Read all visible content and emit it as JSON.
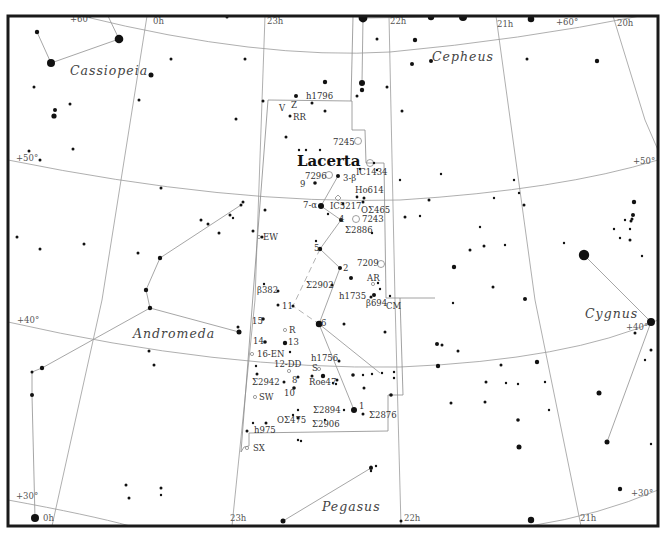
{
  "chart": {
    "title": "Lacerta",
    "frame": {
      "x": 8,
      "y": 16,
      "width": 650,
      "height": 510
    },
    "colors": {
      "background": "#ffffff",
      "stars": "#111111",
      "grid": "#9a9a9a",
      "boundary": "#8a8a8a",
      "figure": "#9c9c9c",
      "frame": "#1a1a1a"
    }
  },
  "ra_labels": [
    {
      "text": "0h",
      "x": 153,
      "y": 24
    },
    {
      "text": "23h",
      "x": 267,
      "y": 24
    },
    {
      "text": "22h",
      "x": 390,
      "y": 24
    },
    {
      "text": "21h",
      "x": 497,
      "y": 27
    },
    {
      "text": "20h",
      "x": 617,
      "y": 26
    },
    {
      "text": "0h",
      "x": 43,
      "y": 521
    },
    {
      "text": "23h",
      "x": 230,
      "y": 521
    },
    {
      "text": "22h",
      "x": 404,
      "y": 521
    },
    {
      "text": "21h",
      "x": 580,
      "y": 521
    }
  ],
  "dec_labels": [
    {
      "text": "+60°",
      "x": 70,
      "y": 22
    },
    {
      "text": "+60°",
      "x": 556,
      "y": 25
    },
    {
      "text": "+50°",
      "x": 16,
      "y": 161
    },
    {
      "text": "+50°",
      "x": 633,
      "y": 164
    },
    {
      "text": "+40°",
      "x": 17,
      "y": 323
    },
    {
      "text": "+40°",
      "x": 626,
      "y": 330
    },
    {
      "text": "+30°",
      "x": 16,
      "y": 499
    },
    {
      "text": "+30°",
      "x": 631,
      "y": 496
    }
  ],
  "constellations": [
    {
      "name": "Lacerta",
      "x": 297,
      "y": 166,
      "main": true
    },
    {
      "name": "Cassiopeia",
      "x": 70,
      "y": 75
    },
    {
      "name": "Cepheus",
      "x": 432,
      "y": 61
    },
    {
      "name": "Andromeda",
      "x": 133,
      "y": 338
    },
    {
      "name": "Cygnus",
      "x": 585,
      "y": 318
    },
    {
      "name": "Pegasus",
      "x": 322,
      "y": 511
    }
  ],
  "object_labels": [
    {
      "text": "h1796",
      "x": 306,
      "y": 99
    },
    {
      "text": "V",
      "x": 279,
      "y": 111
    },
    {
      "text": "Z",
      "x": 291,
      "y": 108
    },
    {
      "text": "RR",
      "x": 293,
      "y": 120
    },
    {
      "text": "7245",
      "x": 333,
      "y": 145
    },
    {
      "text": "IC1434",
      "x": 356,
      "y": 175
    },
    {
      "text": "7296",
      "x": 305,
      "y": 179
    },
    {
      "text": "3-β",
      "x": 343,
      "y": 181
    },
    {
      "text": "9",
      "x": 300,
      "y": 187
    },
    {
      "text": "Ho614",
      "x": 355,
      "y": 193
    },
    {
      "text": "7-α",
      "x": 303,
      "y": 208
    },
    {
      "text": "IC5217",
      "x": 330,
      "y": 209
    },
    {
      "text": "OΣ465",
      "x": 361,
      "y": 213
    },
    {
      "text": "4",
      "x": 339,
      "y": 222
    },
    {
      "text": "7243",
      "x": 362,
      "y": 222
    },
    {
      "text": "Σ2886",
      "x": 345,
      "y": 233
    },
    {
      "text": "EW",
      "x": 263,
      "y": 240
    },
    {
      "text": "5",
      "x": 314,
      "y": 251
    },
    {
      "text": "7209",
      "x": 357,
      "y": 266
    },
    {
      "text": "2",
      "x": 343,
      "y": 271
    },
    {
      "text": "AR",
      "x": 367,
      "y": 281
    },
    {
      "text": "Σ2902",
      "x": 306,
      "y": 288
    },
    {
      "text": "h1735",
      "x": 339,
      "y": 299
    },
    {
      "text": "β382",
      "x": 257,
      "y": 293
    },
    {
      "text": "β694",
      "x": 366,
      "y": 306
    },
    {
      "text": "CM",
      "x": 386,
      "y": 309
    },
    {
      "text": "11",
      "x": 282,
      "y": 309
    },
    {
      "text": "15",
      "x": 252,
      "y": 324
    },
    {
      "text": "6",
      "x": 321,
      "y": 326
    },
    {
      "text": "R",
      "x": 289,
      "y": 333
    },
    {
      "text": "14",
      "x": 253,
      "y": 344
    },
    {
      "text": "13",
      "x": 288,
      "y": 345
    },
    {
      "text": "16-EN",
      "x": 257,
      "y": 357
    },
    {
      "text": "h1756",
      "x": 311,
      "y": 361
    },
    {
      "text": "12-DD",
      "x": 274,
      "y": 367
    },
    {
      "text": "S",
      "x": 312,
      "y": 371
    },
    {
      "text": "Σ2942",
      "x": 252,
      "y": 385
    },
    {
      "text": "8",
      "x": 292,
      "y": 383
    },
    {
      "text": "Roe47",
      "x": 309,
      "y": 385
    },
    {
      "text": "10",
      "x": 284,
      "y": 396
    },
    {
      "text": "SW",
      "x": 259,
      "y": 400
    },
    {
      "text": "Σ2894",
      "x": 313,
      "y": 413
    },
    {
      "text": "1",
      "x": 359,
      "y": 409
    },
    {
      "text": "Σ2876",
      "x": 369,
      "y": 418
    },
    {
      "text": "OΣ475",
      "x": 277,
      "y": 423
    },
    {
      "text": "Σ2906",
      "x": 312,
      "y": 427
    },
    {
      "text": "h975",
      "x": 254,
      "y": 433
    },
    {
      "text": "SX",
      "x": 253,
      "y": 451
    }
  ],
  "dso_markers": [
    {
      "type": "circle",
      "x": 358,
      "y": 141,
      "r": 3.5,
      "label": "7245"
    },
    {
      "type": "circle",
      "x": 370,
      "y": 163,
      "r": 3.5,
      "label": "IC1434"
    },
    {
      "type": "circle",
      "x": 329,
      "y": 175,
      "r": 3.5,
      "label": "7296"
    },
    {
      "type": "diamond",
      "x": 338,
      "y": 198,
      "r": 3,
      "label": "IC5217"
    },
    {
      "type": "circle",
      "x": 356,
      "y": 219,
      "r": 3.5,
      "label": "7243"
    },
    {
      "type": "circle",
      "x": 381,
      "y": 264,
      "r": 3.5,
      "label": "7209"
    },
    {
      "type": "small",
      "x": 373,
      "y": 284,
      "r": 1.6,
      "label": "AR"
    },
    {
      "type": "small",
      "x": 259,
      "y": 237,
      "r": 1.6,
      "label": "EW"
    },
    {
      "type": "small",
      "x": 285,
      "y": 330,
      "r": 1.6,
      "label": "R"
    },
    {
      "type": "small",
      "x": 252,
      "y": 354,
      "r": 1.6,
      "label": "16-EN"
    },
    {
      "type": "small",
      "x": 289,
      "y": 371,
      "r": 1.6,
      "label": "12-DD"
    },
    {
      "type": "small",
      "x": 319,
      "y": 369,
      "r": 1.6,
      "label": "S"
    },
    {
      "type": "small",
      "x": 255,
      "y": 397,
      "r": 1.6,
      "label": "SW"
    },
    {
      "type": "small",
      "x": 247,
      "y": 448,
      "r": 1.6,
      "label": "SX"
    }
  ],
  "stars": [
    [
      37,
      32,
      2.2
    ],
    [
      119,
      39,
      4.3
    ],
    [
      51,
      63,
      4
    ],
    [
      227,
      17,
      1.5
    ],
    [
      171,
      59,
      1.5
    ],
    [
      151,
      75,
      2.5
    ],
    [
      245,
      59,
      1.5
    ],
    [
      34,
      87,
      1.5
    ],
    [
      55,
      110,
      2
    ],
    [
      70,
      104,
      1.5
    ],
    [
      54,
      116,
      2.6
    ],
    [
      139,
      100,
      1.5
    ],
    [
      29,
      151,
      1.5
    ],
    [
      40,
      160,
      1.5
    ],
    [
      73,
      149,
      1.5
    ],
    [
      325,
      82,
      2.2
    ],
    [
      296,
      96,
      2
    ],
    [
      312,
      103,
      1.5
    ],
    [
      290,
      116,
      1.5
    ],
    [
      325,
      111,
      1.5
    ],
    [
      286,
      137,
      1.5
    ],
    [
      263,
      101,
      1.5
    ],
    [
      299,
      150,
      1.2
    ],
    [
      306,
      150,
      1.2
    ],
    [
      320,
      150,
      1.2
    ],
    [
      338,
      176,
      2
    ],
    [
      315,
      183,
      1.8
    ],
    [
      321,
      206,
      3
    ],
    [
      357,
      197,
      1.4
    ],
    [
      364,
      198,
      1.5
    ],
    [
      363,
      202,
      1.5
    ],
    [
      341,
      220,
      2
    ],
    [
      343,
      204,
      1.4
    ],
    [
      328,
      214,
      1.2
    ],
    [
      316,
      241,
      1.2
    ],
    [
      320,
      249,
      2.2
    ],
    [
      340,
      268,
      2
    ],
    [
      332,
      285,
      1.5
    ],
    [
      351,
      278,
      2
    ],
    [
      380,
      289,
      1.2
    ],
    [
      378,
      283,
      1.2
    ],
    [
      374,
      295,
      2
    ],
    [
      371,
      297,
      1.5
    ],
    [
      390,
      296,
      1.2
    ],
    [
      319,
      324,
      3.2
    ],
    [
      293,
      306,
      1.5
    ],
    [
      278,
      291,
      1.5
    ],
    [
      264,
      284,
      1.2
    ],
    [
      278,
      305,
      1.5
    ],
    [
      263,
      319,
      1.8
    ],
    [
      265,
      342,
      1.8
    ],
    [
      285,
      343,
      2.2
    ],
    [
      290,
      352,
      1.2
    ],
    [
      344,
      324,
      1.5
    ],
    [
      339,
      361,
      1.5
    ],
    [
      337,
      380,
      1.5
    ],
    [
      336,
      384,
      1.2
    ],
    [
      323,
      376,
      2.2
    ],
    [
      312,
      376,
      1.5
    ],
    [
      298,
      377,
      1.5
    ],
    [
      294,
      388,
      1.8
    ],
    [
      284,
      382,
      1.5
    ],
    [
      256,
      366,
      1.2
    ],
    [
      257,
      374,
      1.5
    ],
    [
      353,
      375,
      1.8
    ],
    [
      363,
      375,
      1.2
    ],
    [
      372,
      374,
      1.2
    ],
    [
      382,
      373,
      1.2
    ],
    [
      394,
      372,
      1.2
    ],
    [
      394,
      378,
      1.2
    ],
    [
      354,
      410,
      3
    ],
    [
      363,
      414,
      1.5
    ],
    [
      344,
      410,
      1.2
    ],
    [
      298,
      410,
      1.2
    ],
    [
      293,
      415,
      1.2
    ],
    [
      298,
      418,
      1.5
    ],
    [
      266,
      423,
      1.5
    ],
    [
      253,
      423,
      1.2
    ],
    [
      325,
      420,
      1.2
    ],
    [
      247,
      431,
      1.5
    ],
    [
      298,
      440,
      1.2
    ],
    [
      301,
      441,
      1.2
    ],
    [
      236,
      119,
      1.5
    ],
    [
      243,
      202,
      1.5
    ],
    [
      265,
      210,
      1.5
    ],
    [
      253,
      231,
      1.5
    ],
    [
      262,
      237,
      1.5
    ],
    [
      219,
      233,
      1.5
    ],
    [
      208,
      224,
      1.5
    ],
    [
      201,
      220,
      1.5
    ],
    [
      230,
      215,
      1.5
    ],
    [
      233,
      218,
      1.2
    ],
    [
      241,
      205,
      1.5
    ],
    [
      161,
      188,
      1.5
    ],
    [
      84,
      244,
      1.5
    ],
    [
      40,
      249,
      1.5
    ],
    [
      17,
      237,
      1.5
    ],
    [
      138,
      253,
      1.5
    ],
    [
      160,
      258,
      2.2
    ],
    [
      146,
      290,
      2.2
    ],
    [
      150,
      308,
      2.2
    ],
    [
      238,
      327,
      1.5
    ],
    [
      239,
      332,
      2.5
    ],
    [
      149,
      351,
      1.5
    ],
    [
      154,
      365,
      1.5
    ],
    [
      42,
      368,
      2.2
    ],
    [
      32,
      372,
      1.5
    ],
    [
      32,
      395,
      2
    ],
    [
      126,
      485,
      1.5
    ],
    [
      129,
      498,
      1.5
    ],
    [
      161,
      488,
      1.5
    ],
    [
      161,
      495,
      1.2
    ],
    [
      35,
      518,
      4
    ],
    [
      283,
      521,
      2.5
    ],
    [
      364,
      388,
      1.5
    ],
    [
      371,
      467,
      1.5
    ],
    [
      371,
      471,
      1.2
    ],
    [
      376,
      466,
      1.2
    ],
    [
      333,
      383,
      1.2
    ],
    [
      391,
      395,
      1.8
    ],
    [
      363,
      18,
      4.4
    ],
    [
      431,
      17,
      3.2
    ],
    [
      377,
      39,
      1.5
    ],
    [
      415,
      40,
      2.2
    ],
    [
      362,
      83,
      3
    ],
    [
      412,
      64,
      2
    ],
    [
      362,
      90,
      2.2
    ],
    [
      357,
      96,
      1.5
    ],
    [
      387,
      87,
      1.5
    ],
    [
      402,
      111,
      1.5
    ],
    [
      431,
      61,
      2
    ],
    [
      463,
      17,
      4
    ],
    [
      531,
      19,
      3.3
    ],
    [
      527,
      59,
      1.5
    ],
    [
      597,
      61,
      2.2
    ],
    [
      360,
      169,
      1.2
    ],
    [
      377,
      170,
      1.2
    ],
    [
      374,
      163,
      1.2
    ],
    [
      400,
      180,
      1.2
    ],
    [
      441,
      174,
      1.2
    ],
    [
      429,
      200,
      1.5
    ],
    [
      420,
      216,
      1.2
    ],
    [
      372,
      233,
      1.2
    ],
    [
      405,
      217,
      1.5
    ],
    [
      480,
      227,
      1.2
    ],
    [
      514,
      180,
      1.2
    ],
    [
      519,
      193,
      1.2
    ],
    [
      524,
      205,
      1.5
    ],
    [
      494,
      198,
      1.2
    ],
    [
      505,
      245,
      1.2
    ],
    [
      470,
      250,
      1.5
    ],
    [
      484,
      246,
      1.5
    ],
    [
      454,
      267,
      2.2
    ],
    [
      453,
      303,
      1.2
    ],
    [
      493,
      287,
      1.5
    ],
    [
      525,
      299,
      2
    ],
    [
      385,
      332,
      1.5
    ],
    [
      437,
      344,
      2
    ],
    [
      442,
      345,
      1.5
    ],
    [
      458,
      351,
      1.5
    ],
    [
      438,
      366,
      2.2
    ],
    [
      501,
      365,
      1.5
    ],
    [
      486,
      382,
      1.5
    ],
    [
      506,
      383,
      1.2
    ],
    [
      518,
      384,
      1.2
    ],
    [
      537,
      362,
      2.2
    ],
    [
      518,
      420,
      1.8
    ],
    [
      519,
      447,
      2.5
    ],
    [
      545,
      382,
      1.2
    ],
    [
      549,
      410,
      1.2
    ],
    [
      451,
      403,
      1.5
    ],
    [
      485,
      402,
      1.5
    ],
    [
      584,
      255,
      5.2
    ],
    [
      564,
      243,
      1.2
    ],
    [
      634,
      202,
      2.2
    ],
    [
      633,
      215,
      2
    ],
    [
      632,
      219,
      1.5
    ],
    [
      631,
      221,
      1.5
    ],
    [
      625,
      220,
      1.2
    ],
    [
      630,
      229,
      1.2
    ],
    [
      614,
      229,
      1.2
    ],
    [
      620,
      238,
      1.2
    ],
    [
      630,
      240,
      1.5
    ],
    [
      642,
      256,
      1.2
    ],
    [
      651,
      322,
      4
    ],
    [
      635,
      333,
      1.5
    ],
    [
      651,
      350,
      1.5
    ],
    [
      599,
      393,
      2.5
    ],
    [
      645,
      360,
      1.2
    ],
    [
      607,
      442,
      2.5
    ],
    [
      620,
      489,
      2.2
    ],
    [
      651,
      444,
      1.2
    ],
    [
      531,
      520,
      3.2
    ],
    [
      401,
      521,
      1.5
    ],
    [
      371,
      468,
      2
    ]
  ],
  "figures": [
    {
      "points": [
        [
          51,
          63
        ],
        [
          119,
          39
        ]
      ]
    },
    {
      "points": [
        [
          37,
          32
        ],
        [
          51,
          63
        ]
      ]
    },
    {
      "points": [
        [
          119,
          39
        ],
        [
          108,
          16
        ]
      ]
    },
    {
      "points": [
        [
          363,
          18
        ],
        [
          431,
          17
        ]
      ]
    },
    {
      "points": [
        [
          363,
          18
        ],
        [
          362,
          83
        ]
      ]
    },
    {
      "points": [
        [
          431,
          17
        ],
        [
          440,
          16
        ]
      ]
    },
    {
      "points": [
        [
          338,
          176
        ],
        [
          321,
          206
        ],
        [
          341,
          220
        ],
        [
          320,
          249
        ],
        [
          340,
          268
        ],
        [
          319,
          324
        ],
        [
          354,
          410
        ]
      ]
    },
    {
      "points": [
        [
          319,
          324
        ],
        [
          380,
          373
        ]
      ]
    },
    {
      "points": [
        [
          241,
          205
        ],
        [
          160,
          258
        ],
        [
          146,
          290
        ],
        [
          150,
          308
        ],
        [
          239,
          332
        ]
      ]
    },
    {
      "points": [
        [
          150,
          308
        ],
        [
          42,
          368
        ],
        [
          32,
          372
        ],
        [
          32,
          395
        ],
        [
          35,
          518
        ]
      ]
    },
    {
      "points": [
        [
          584,
          255
        ],
        [
          651,
          322
        ]
      ]
    },
    {
      "points": [
        [
          651,
          322
        ],
        [
          607,
          442
        ]
      ]
    },
    {
      "points": [
        [
          283,
          521
        ],
        [
          371,
          468
        ]
      ]
    }
  ],
  "figures_dashed": [
    {
      "points": [
        [
          320,
          249
        ],
        [
          293,
          306
        ],
        [
          319,
          324
        ]
      ]
    }
  ],
  "meridians": [
    {
      "label": "0h",
      "points": [
        [
          147,
          16
        ],
        [
          102,
          300
        ],
        [
          52,
          526
        ]
      ]
    },
    {
      "label": "23h",
      "points": [
        [
          265,
          16
        ],
        [
          255,
          300
        ],
        [
          232,
          526
        ]
      ]
    },
    {
      "label": "22h",
      "points": [
        [
          389,
          16
        ],
        [
          395,
          300
        ],
        [
          401,
          526
        ]
      ]
    },
    {
      "label": "21h",
      "points": [
        [
          496,
          16
        ],
        [
          535,
          300
        ],
        [
          581,
          526
        ]
      ]
    },
    {
      "label": "20h",
      "points": [
        [
          613,
          16
        ],
        [
          645,
          120
        ],
        [
          658,
          150
        ]
      ]
    }
  ],
  "parallels": [
    {
      "label": "+60",
      "d": "M 82 16 Q 260 60 390 52 Q 520 40 640 16"
    },
    {
      "label": "+50",
      "d": "M 8 160 Q 230 205 400 200 Q 560 190 658 160"
    },
    {
      "label": "+40",
      "d": "M 8 322 Q 220 370 400 367 Q 570 360 658 320"
    },
    {
      "label": "+30",
      "d": "M 8 500 Q 90 515 130 526 M 530 526 Q 600 515 658 490"
    }
  ],
  "boundaries": [
    {
      "d": "M 268 100 L 352 101 L 352 130 L 365 130 L 366 163 L 384 163 L 386 298 L 400 298 L 403 395 L 388 395 L 388 431 L 249 433 L 249 446 L 244 447 L 241 452"
    },
    {
      "d": "M 268 100 L 241 452"
    },
    {
      "d": "M 351 101 L 353 17"
    },
    {
      "d": "M 400 298 L 435 298"
    }
  ]
}
